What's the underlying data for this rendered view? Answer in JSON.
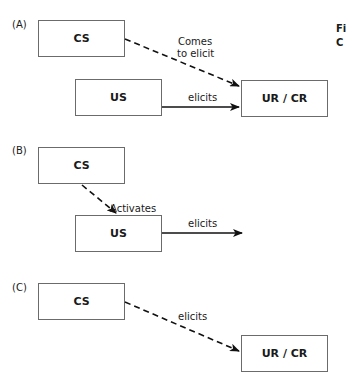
{
  "caption": {
    "line1": "Fi",
    "line2": "C"
  },
  "panels": [
    {
      "label": "(A)",
      "nodes": {
        "cs": "CS",
        "us": "US",
        "response": "UR / CR"
      },
      "edges": [
        {
          "from": "CS",
          "to": "UR / CR",
          "style": "dashed",
          "label_line1": "Comes",
          "label_line2": "to elicit"
        },
        {
          "from": "US",
          "to": "UR / CR",
          "style": "solid",
          "label": "elicits"
        }
      ]
    },
    {
      "label": "(B)",
      "nodes": {
        "cs": "CS",
        "us": "US"
      },
      "edges": [
        {
          "from": "CS",
          "to": "US",
          "style": "dashed",
          "label": "Activates"
        },
        {
          "from": "US",
          "to": "",
          "style": "solid",
          "label": "elicits"
        }
      ]
    },
    {
      "label": "(C)",
      "nodes": {
        "cs": "CS",
        "response": "UR / CR"
      },
      "edges": [
        {
          "from": "CS",
          "to": "UR / CR",
          "style": "dashed",
          "label": "elicits"
        }
      ]
    }
  ],
  "colors": {
    "box_border": "#6b6b6b",
    "arrow": "#111111",
    "text": "#1a1a1a",
    "background": "#ffffff"
  }
}
